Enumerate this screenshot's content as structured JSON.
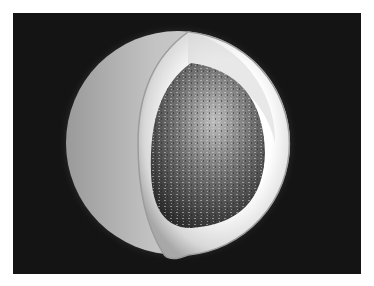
{
  "image": {
    "subject": "cutaway sphere showing layered interior with textured core",
    "colors": {
      "background": "#141414",
      "outer_shell": "#bdbdbd",
      "inner_glow": "#f2f2f2",
      "core": "#5a5a5a"
    }
  }
}
